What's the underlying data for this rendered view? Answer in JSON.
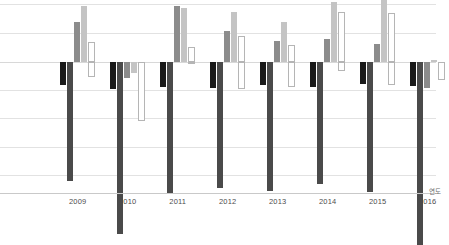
{
  "chart_data": {
    "type": "bar",
    "title": "",
    "xlabel": "연도",
    "ylabel": "",
    "grid": true,
    "legend": "none",
    "orientation": "vertical",
    "grouping": "clustered",
    "zero_baseline": true,
    "ylim": [
      -6.8,
      2.2
    ],
    "yticks": [
      2.0,
      1.0,
      0.0,
      -1.0,
      -2.0,
      -3.0,
      -4.6
    ],
    "categories": [
      "2009",
      "2010",
      "2011",
      "2012",
      "2013",
      "2014",
      "2015",
      "2016"
    ],
    "series": [
      {
        "name": "series-1",
        "color": "#1a1a1a",
        "values": [
          -0.82,
          -0.95,
          -0.86,
          -0.9,
          -0.8,
          -0.88,
          -0.78,
          -0.85
        ]
      },
      {
        "name": "series-2",
        "color": "#4a4a4a",
        "values": [
          -4.15,
          -6.0,
          -4.6,
          -4.4,
          -4.52,
          -4.25,
          -4.55,
          -6.4
        ]
      },
      {
        "name": "series-3",
        "color": "#8c8c8c",
        "values": [
          1.4,
          -0.55,
          1.95,
          1.1,
          0.72,
          0.82,
          0.62,
          -0.92
        ]
      },
      {
        "name": "series-4",
        "color": "#c4c4c4",
        "values": [
          1.95,
          -0.4,
          1.9,
          1.75,
          1.4,
          2.1,
          2.4,
          0.08
        ]
      },
      {
        "name": "series-5",
        "color": "#ffffff",
        "border": "#b5b5b5",
        "values": [
          0.7,
          -0.62,
          0.52,
          0.92,
          0.58,
          1.75,
          1.7,
          -0.1
        ]
      }
    ],
    "series_negative_tail": {
      "note": "white outlined bars drop below zero in some years",
      "values_below_zero": [
        -0.52,
        -2.05,
        -0.02,
        -0.95,
        -0.88,
        -0.3,
        -0.8,
        -0.62
      ]
    }
  },
  "axis": {
    "x_title": "연도",
    "tick_labels": [
      "2009",
      "2010",
      "2011",
      "2012",
      "2013",
      "2014",
      "2015",
      "2016"
    ]
  }
}
